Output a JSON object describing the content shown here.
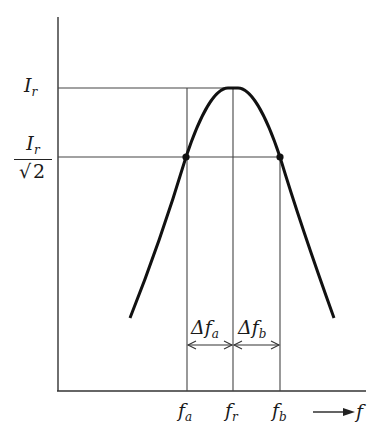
{
  "diagram": {
    "type": "resonance-curve",
    "y_labels": {
      "peak": {
        "symbol": "I",
        "subscript": "r"
      },
      "half_power": {
        "num_symbol": "I",
        "num_subscript": "r",
        "den_radical": "√",
        "den_value": "2"
      }
    },
    "x_labels": {
      "fa": {
        "symbol": "f",
        "subscript": "a"
      },
      "fr": {
        "symbol": "f",
        "subscript": "r"
      },
      "fb": {
        "symbol": "f",
        "subscript": "b"
      },
      "axis": {
        "symbol": "f"
      }
    },
    "bandwidth_labels": {
      "dfa": {
        "symbol": "Δf",
        "subscript": "a"
      },
      "dfb": {
        "symbol": "Δf",
        "subscript": "b"
      }
    },
    "colors": {
      "line": "#222222",
      "curve": "#111111",
      "background": "#ffffff"
    }
  }
}
